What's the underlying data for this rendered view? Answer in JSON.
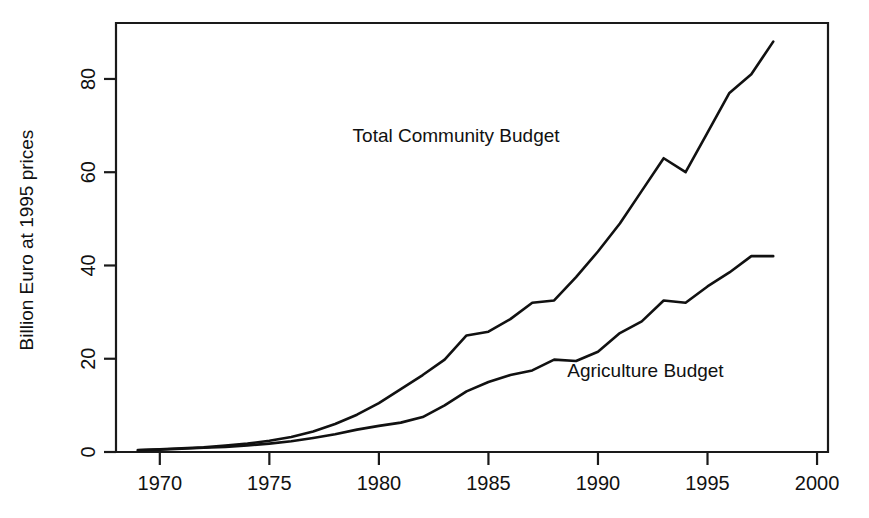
{
  "chart_data": {
    "type": "line",
    "title": "",
    "subtitle": "",
    "xlabel": "",
    "ylabel": "Billion Euro at 1995 prices",
    "xlim": [
      1968,
      2000.5
    ],
    "ylim": [
      0,
      92
    ],
    "xticks": [
      1970,
      1975,
      1980,
      1985,
      1990,
      1995,
      2000
    ],
    "xtick_labels": [
      "1970",
      "1975",
      "1980",
      "1985",
      "1990",
      "1995",
      "2000"
    ],
    "yticks": [
      0,
      20,
      40,
      60,
      80
    ],
    "ytick_labels": [
      "0",
      "20",
      "40",
      "60",
      "80"
    ],
    "grid": false,
    "legend_position": "inline-annotation",
    "line_color": "#111111",
    "x": [
      1969,
      1970,
      1971,
      1972,
      1973,
      1974,
      1975,
      1976,
      1977,
      1978,
      1979,
      1980,
      1981,
      1982,
      1983,
      1984,
      1985,
      1986,
      1987,
      1988,
      1989,
      1990,
      1991,
      1992,
      1993,
      1994,
      1995,
      1996,
      1997,
      1998
    ],
    "series": [
      {
        "name": "Total Community Budget",
        "label": "Total Community Budget",
        "label_x": 1978.8,
        "label_y": 66.5,
        "values": [
          0.4,
          0.6,
          0.8,
          1.0,
          1.4,
          1.8,
          2.4,
          3.2,
          4.4,
          6.0,
          8.0,
          10.5,
          13.5,
          16.5,
          19.8,
          25.0,
          25.8,
          28.5,
          32.0,
          32.5,
          37.5,
          43.0,
          49.0,
          56.0,
          63.0,
          60.0,
          68.5,
          77.0,
          81.0,
          88.0
        ]
      },
      {
        "name": "Agriculture Budget",
        "label": "Agriculture Budget",
        "label_x": 1988.6,
        "label_y": 16.0,
        "values": [
          0.35,
          0.5,
          0.7,
          0.9,
          1.1,
          1.4,
          1.8,
          2.3,
          3.0,
          3.8,
          4.8,
          5.6,
          6.3,
          7.5,
          10.0,
          13.0,
          15.0,
          16.5,
          17.5,
          19.8,
          19.5,
          21.5,
          25.5,
          28.0,
          32.5,
          32.0,
          35.5,
          38.5,
          42.0,
          42.0
        ]
      }
    ]
  },
  "annotations": {
    "total_label": "Total Community Budget",
    "agriculture_label": "Agriculture Budget"
  },
  "axes": {
    "y_title": "Billion Euro at 1995 prices"
  }
}
